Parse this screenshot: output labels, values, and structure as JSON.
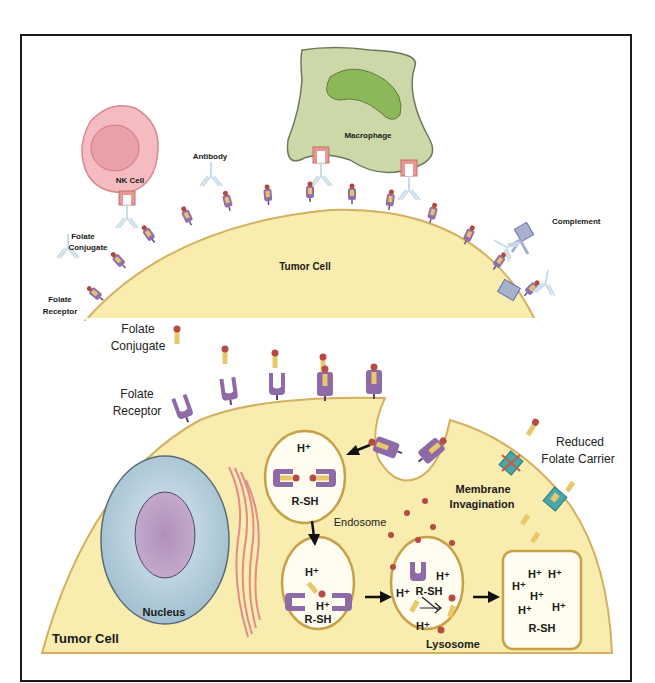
{
  "top_panel": {
    "labels": {
      "nk_cell": "NK Cell",
      "macrophage": "Macrophage",
      "antibody": "Antibody",
      "complement": "Complement",
      "folate_conjugate_line1": "Folate",
      "folate_conjugate_line2": "Conjugate",
      "folate_receptor_line1": "Folate",
      "folate_receptor_line2": "Receptor",
      "tumor_cell": "Tumor Cell"
    }
  },
  "bottom_panel": {
    "labels": {
      "folate_conjugate_line1": "Folate",
      "folate_conjugate_line2": "Conjugate",
      "folate_receptor_line1": "Folate",
      "folate_receptor_line2": "Receptor",
      "reduced_folate_carrier_line1": "Reduced",
      "reduced_folate_carrier_line2": "Folate Carrier",
      "membrane_invagination_line1": "Membrane",
      "membrane_invagination_line2": "Invagination",
      "endosome": "Endosome",
      "nucleus": "Nucleus",
      "lysosome": "Lysosome",
      "tumor_cell": "Tumor Cell"
    },
    "endosome1": {
      "h_plus": "H⁺",
      "rsh": "R-SH"
    },
    "endosome2": {
      "h_plus_1": "H⁺",
      "h_plus_2": "H⁺",
      "rsh": "R-SH"
    },
    "endosome3": {
      "h_plus_1": "H⁺",
      "h_plus_2": "H⁺",
      "h_plus_3": "H⁺",
      "rsh": "R-SH"
    },
    "lysosome_box": {
      "h_plus_1": "H⁺",
      "h_plus_2": "H⁺",
      "h_plus_3": "H⁺",
      "h_plus_4": "H⁺",
      "h_plus_5": "H⁺",
      "h_plus_6": "H⁺",
      "rsh": "R-SH"
    }
  },
  "colors": {
    "tumor_fill": "#f8ecae",
    "tumor_border": "#d4b060",
    "nk_fill": "#f2b8bc",
    "nk_nucleus": "#e8a0a8",
    "macrophage_fill": "#cdd8a8",
    "macrophage_nucleus": "#8db85a",
    "receptor_purple": "#8e6aa6",
    "nucleus_outer": "#a8c4d4",
    "nucleus_inner": "#b898c0",
    "er_pink": "#e07a84",
    "folate_red": "#c0504a",
    "carrier_teal": "#4aa6a8"
  }
}
